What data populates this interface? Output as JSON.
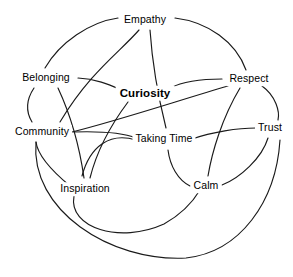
{
  "diagram": {
    "type": "node-link-network",
    "canvas": {
      "width": 293,
      "height": 277,
      "background": "#ffffff"
    },
    "style": {
      "edge_color": "#1a1a1a",
      "label_color": "#000000",
      "edge_width": 1.15
    },
    "nodes": [
      {
        "id": "empathy",
        "label": "Empathy",
        "x": 145,
        "y": 20,
        "emphasis": false
      },
      {
        "id": "belonging",
        "label": "Belonging",
        "x": 46,
        "y": 78,
        "emphasis": false
      },
      {
        "id": "curiosity",
        "label": "Curiosity",
        "x": 145,
        "y": 93,
        "emphasis": true
      },
      {
        "id": "respect",
        "label": "Respect",
        "x": 249,
        "y": 79,
        "emphasis": false
      },
      {
        "id": "community",
        "label": "Community",
        "x": 42,
        "y": 132,
        "emphasis": false
      },
      {
        "id": "taking_time",
        "label": "Taking Time",
        "x": 164,
        "y": 139,
        "emphasis": false
      },
      {
        "id": "trust",
        "label": "Trust",
        "x": 270,
        "y": 128,
        "emphasis": false
      },
      {
        "id": "inspiration",
        "label": "Inspiration",
        "x": 85,
        "y": 189,
        "emphasis": false
      },
      {
        "id": "calm",
        "label": "Calm",
        "x": 206,
        "y": 186,
        "emphasis": false
      }
    ],
    "edges": [
      {
        "id": "e1",
        "from": "empathy",
        "to": "belonging",
        "path": "M 118 18 C 90 22 60 42 45 68"
      },
      {
        "id": "e2",
        "from": "empathy",
        "to": "respect",
        "path": "M 175 18 C 208 22 236 42 246 70"
      },
      {
        "id": "e3",
        "from": "empathy",
        "to": "community",
        "path": "M 139 30 C 120 52 90 72 60 122"
      },
      {
        "id": "e4",
        "from": "empathy",
        "to": "taking_time",
        "path": "M 150 30 C 152 60 158 96 166 128"
      },
      {
        "id": "e5",
        "from": "belonging",
        "to": "curiosity",
        "path": "M 78 78 C 98 79 112 86 124 91"
      },
      {
        "id": "e6",
        "from": "belonging",
        "to": "community",
        "path": "M 34 88 C 26 100 26 112 32 122"
      },
      {
        "id": "e7",
        "from": "belonging",
        "to": "inspiration",
        "path": "M 58 88 C 72 118 80 150 84 178"
      },
      {
        "id": "e8",
        "from": "respect",
        "to": "curiosity",
        "path": "M 222 79 C 200 79 182 82 170 88"
      },
      {
        "id": "e9",
        "from": "respect",
        "to": "community",
        "path": "M 228 86 C 180 100 120 120 72 132"
      },
      {
        "id": "e10",
        "from": "respect",
        "to": "trust",
        "path": "M 262 86 C 276 96 280 112 278 120"
      },
      {
        "id": "e11",
        "from": "respect",
        "to": "calm",
        "path": "M 240 88 C 222 118 212 152 208 176"
      },
      {
        "id": "e12",
        "from": "community",
        "to": "taking_time",
        "path": "M 74 132 C 106 131 126 134 136 138"
      },
      {
        "id": "e13",
        "from": "community",
        "to": "inspiration",
        "path": "M 36 142 C 38 158 58 176 70 186"
      },
      {
        "id": "e14",
        "from": "community",
        "to": "trust",
        "path": "M 36 142 C 30 210 110 262 186 258 C 240 252 276 202 280 140"
      },
      {
        "id": "e15",
        "from": "taking_time",
        "to": "trust",
        "path": "M 192 139 C 212 132 238 128 256 128"
      },
      {
        "id": "e16",
        "from": "taking_time",
        "to": "calm",
        "path": "M 168 150 C 170 166 178 180 190 186"
      },
      {
        "id": "e17",
        "from": "taking_time",
        "to": "inspiration",
        "path": "M 136 140 C 110 132 90 146 82 176"
      },
      {
        "id": "e18",
        "from": "inspiration",
        "to": "calm",
        "path": "M 74 196 C 68 228 120 244 164 224 C 182 214 194 200 200 190"
      },
      {
        "id": "e19",
        "from": "trust",
        "to": "calm",
        "path": "M 268 138 C 262 158 240 178 222 185"
      },
      {
        "id": "e20",
        "from": "curiosity",
        "to": "inspiration",
        "path": "M 128 102 C 110 126 96 154 90 178"
      }
    ]
  }
}
